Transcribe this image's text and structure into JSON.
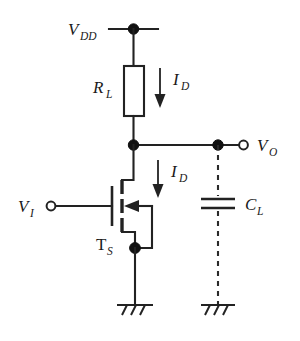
{
  "figure": {
    "name": "nmos-resistive-load-inverter"
  },
  "labels": {
    "supply": {
      "symbol": "V",
      "subscript": "DD",
      "full": "V_DD"
    },
    "load_resistor": {
      "symbol": "R",
      "subscript": "L",
      "full": "R_L"
    },
    "drain_current_top": {
      "symbol": "I",
      "subscript": "D",
      "full": "I_D"
    },
    "drain_current_mid": {
      "symbol": "I",
      "subscript": "D",
      "full": "I_D"
    },
    "output": {
      "symbol": "V",
      "subscript": "O",
      "full": "V_O"
    },
    "input": {
      "symbol": "V",
      "subscript": "I",
      "full": "V_I"
    },
    "transistor": {
      "symbol": "T",
      "subscript": "S",
      "full": "T_S"
    },
    "load_capacitor": {
      "symbol": "C",
      "subscript": "L",
      "full": "C_L"
    }
  },
  "components": {
    "resistor": {
      "name": "load-resistor",
      "type": "resistor"
    },
    "transistor": {
      "name": "nmos-transistor",
      "type": "n-channel-mosfet"
    },
    "capacitor": {
      "name": "load-capacitor",
      "type": "capacitor",
      "style": "dashed-connection"
    },
    "ground_source": {
      "name": "ground-source",
      "type": "earth-ground"
    },
    "ground_capacitor": {
      "name": "ground-capacitor",
      "type": "earth-ground"
    }
  },
  "terminals": {
    "input_terminal": {
      "name": "input-terminal",
      "style": "open-circle"
    },
    "output_terminal": {
      "name": "output-terminal",
      "style": "open-circle"
    }
  },
  "nodes": {
    "supply_node": {
      "name": "supply-node",
      "style": "filled-dot"
    },
    "output_node": {
      "name": "output-node",
      "style": "filled-dot"
    },
    "output_branch_node": {
      "name": "output-branch-node",
      "style": "filled-dot"
    },
    "source_node": {
      "name": "source-node",
      "style": "filled-dot"
    }
  },
  "colors": {
    "wire": "#222222",
    "node": "#111111",
    "background": "#ffffff",
    "text": "#1a1a1a"
  }
}
